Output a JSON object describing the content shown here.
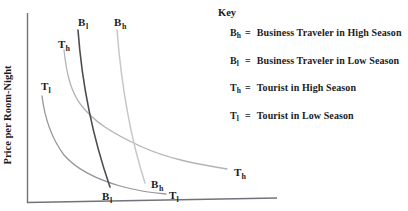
{
  "figure": {
    "y_axis_label": "Price per Room-Night",
    "axis_color": "#72727a",
    "text_color": "#1c1c1c",
    "key": {
      "title": "Key",
      "eq": "=",
      "entries": [
        {
          "base": "B",
          "sub": "h",
          "text": "Business Traveler in High Season"
        },
        {
          "base": "B",
          "sub": "l",
          "text": "Business Traveler in Low Season"
        },
        {
          "base": "T",
          "sub": "h",
          "text": "Tourist in High Season"
        },
        {
          "base": "T",
          "sub": "l",
          "text": "Tourist in Low Season"
        }
      ]
    },
    "labels": {
      "bl_top": {
        "base": "B",
        "sub": "l"
      },
      "bh_top": {
        "base": "B",
        "sub": "h"
      },
      "th_top": {
        "base": "T",
        "sub": "h"
      },
      "tl_top": {
        "base": "T",
        "sub": "l"
      },
      "bl_bottom": {
        "base": "B",
        "sub": "l"
      },
      "bh_bottom": {
        "base": "B",
        "sub": "h"
      },
      "tl_bottom": {
        "base": "T",
        "sub": "l"
      },
      "th_right": {
        "base": "T",
        "sub": "h"
      }
    },
    "curves": [
      {
        "id": "Tl",
        "name": "tourist-low-season-curve",
        "color": "#96969c",
        "width": 1.3,
        "path": "M 42 96 C 45 120 52 139 64 155 C 76 169 96 179 120 186 C 138 191 153 193 166 194"
      },
      {
        "id": "Th",
        "name": "tourist-high-season-curve",
        "color": "#b3b3b7",
        "width": 1.3,
        "path": "M 64 50 C 67 78 72 93 81 105 C 94 122 112 133 140 146 C 168 159 197 164 227 169"
      },
      {
        "id": "Bh",
        "name": "business-high-season-curve",
        "color": "#c7c7cb",
        "width": 1.5,
        "path": "M 117 30 Q 124 118 145 183"
      },
      {
        "id": "Bl",
        "name": "business-low-season-curve",
        "color": "#4c4c52",
        "width": 1.6,
        "path": "M 78 30 Q 84 112 110 187"
      }
    ]
  },
  "chart_data": {
    "type": "line",
    "title": "",
    "xlabel": "",
    "ylabel": "Price per Room-Night",
    "x_ticks": [],
    "y_ticks": [],
    "grid": false,
    "legend_title": "Key",
    "legend_position": "top-right",
    "legend_entries": [
      "Bh = Business Traveler in High Season",
      "Bl = Business Traveler in Low Season",
      "Th = Tourist in High Season",
      "Tl = Tourist in Low Season"
    ],
    "series": [
      {
        "name": "Business Traveler in High Season",
        "label": "Bh",
        "approx_points": [
          [
            3.6,
            9.1
          ],
          [
            3.9,
            5.3
          ],
          [
            4.7,
            1.1
          ]
        ]
      },
      {
        "name": "Business Traveler in Low Season",
        "label": "Bl",
        "approx_points": [
          [
            2.0,
            9.1
          ],
          [
            2.6,
            4.5
          ],
          [
            3.3,
            0.8
          ]
        ]
      },
      {
        "name": "Tourist in High Season",
        "label": "Th",
        "approx_points": [
          [
            1.5,
            8.1
          ],
          [
            2.2,
            5.2
          ],
          [
            4.5,
            3.0
          ],
          [
            8.0,
            1.8
          ]
        ]
      },
      {
        "name": "Tourist in Low Season",
        "label": "Tl",
        "approx_points": [
          [
            0.6,
            5.6
          ],
          [
            1.5,
            2.5
          ],
          [
            3.7,
            0.9
          ],
          [
            5.6,
            0.5
          ]
        ]
      }
    ],
    "axes_note": "Qualitative demand curves; no numeric tick labels shown, points are relative 0-10 estimates"
  }
}
